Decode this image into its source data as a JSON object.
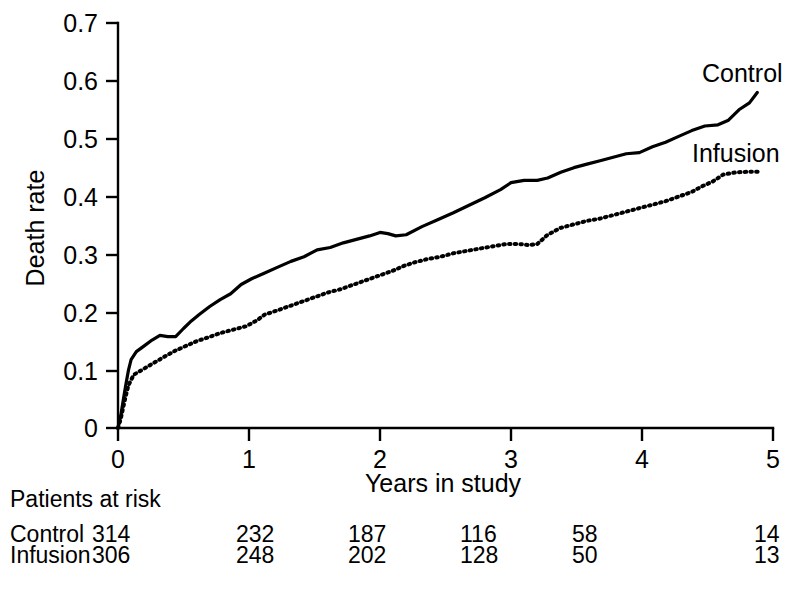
{
  "chart_data": {
    "type": "line",
    "title": "",
    "xlabel": "Years in study",
    "ylabel": "Death rate",
    "xlim": [
      0,
      5
    ],
    "ylim": [
      0,
      0.7
    ],
    "xticks": [
      "0",
      "1",
      "2",
      "3",
      "4",
      "5"
    ],
    "xtick_values": [
      0,
      1,
      2,
      3,
      4,
      5
    ],
    "yticks": [
      "0",
      "0.1",
      "0.2",
      "0.3",
      "0.4",
      "0.5",
      "0.6",
      "0.7"
    ],
    "ytick_values": [
      0,
      0.1,
      0.2,
      0.3,
      0.4,
      0.5,
      0.6,
      0.7
    ],
    "grid": false,
    "legend_position": "inline-right-of-curves",
    "series": [
      {
        "name": "Control",
        "style": "solid",
        "label": "Control",
        "x": [
          0.0,
          0.02,
          0.04,
          0.06,
          0.08,
          0.1,
          0.14,
          0.2,
          0.26,
          0.32,
          0.38,
          0.44,
          0.5,
          0.56,
          0.62,
          0.7,
          0.78,
          0.86,
          0.94,
          1.02,
          1.12,
          1.22,
          1.32,
          1.42,
          1.52,
          1.62,
          1.72,
          1.82,
          1.92,
          2.0,
          2.06,
          2.12,
          2.2,
          2.32,
          2.44,
          2.56,
          2.68,
          2.8,
          2.92,
          3.0,
          3.1,
          3.2,
          3.28,
          3.38,
          3.48,
          3.58,
          3.68,
          3.78,
          3.88,
          3.98,
          4.08,
          4.18,
          4.28,
          4.38,
          4.48,
          4.58,
          4.66,
          4.74,
          4.82,
          4.88
        ],
        "y": [
          0.0,
          0.02,
          0.048,
          0.075,
          0.1,
          0.118,
          0.132,
          0.142,
          0.152,
          0.16,
          0.158,
          0.158,
          0.172,
          0.185,
          0.196,
          0.21,
          0.222,
          0.232,
          0.248,
          0.258,
          0.268,
          0.278,
          0.288,
          0.296,
          0.308,
          0.312,
          0.32,
          0.326,
          0.332,
          0.338,
          0.336,
          0.332,
          0.334,
          0.348,
          0.36,
          0.372,
          0.385,
          0.398,
          0.412,
          0.424,
          0.428,
          0.428,
          0.432,
          0.442,
          0.45,
          0.456,
          0.462,
          0.468,
          0.474,
          0.476,
          0.486,
          0.494,
          0.504,
          0.514,
          0.522,
          0.524,
          0.532,
          0.55,
          0.562,
          0.58
        ]
      },
      {
        "name": "Infusion",
        "style": "dotted",
        "label": "Infusion",
        "x": [
          0.0,
          0.02,
          0.04,
          0.06,
          0.08,
          0.12,
          0.18,
          0.24,
          0.3,
          0.36,
          0.44,
          0.52,
          0.6,
          0.68,
          0.78,
          0.88,
          0.98,
          1.06,
          1.12,
          1.2,
          1.3,
          1.4,
          1.5,
          1.6,
          1.7,
          1.8,
          1.9,
          2.0,
          2.1,
          2.18,
          2.26,
          2.36,
          2.46,
          2.56,
          2.66,
          2.76,
          2.86,
          2.96,
          3.06,
          3.14,
          3.2,
          3.28,
          3.38,
          3.48,
          3.58,
          3.68,
          3.78,
          3.88,
          3.98,
          4.08,
          4.18,
          4.28,
          4.38,
          4.46,
          4.54,
          4.62,
          4.72,
          4.82,
          4.9
        ],
        "y": [
          0.0,
          0.015,
          0.036,
          0.056,
          0.074,
          0.092,
          0.1,
          0.108,
          0.116,
          0.124,
          0.134,
          0.142,
          0.15,
          0.156,
          0.164,
          0.17,
          0.176,
          0.186,
          0.196,
          0.202,
          0.21,
          0.218,
          0.226,
          0.234,
          0.24,
          0.248,
          0.256,
          0.264,
          0.272,
          0.28,
          0.286,
          0.292,
          0.296,
          0.302,
          0.306,
          0.31,
          0.314,
          0.318,
          0.318,
          0.316,
          0.318,
          0.334,
          0.346,
          0.352,
          0.358,
          0.362,
          0.368,
          0.374,
          0.38,
          0.386,
          0.392,
          0.4,
          0.408,
          0.418,
          0.426,
          0.438,
          0.442,
          0.443,
          0.443
        ]
      }
    ]
  },
  "risk_table": {
    "heading": "Patients at risk",
    "column_x_values": [
      0,
      1,
      2,
      3,
      4,
      5
    ],
    "rows": [
      {
        "label": "Control",
        "values": [
          "314",
          "232",
          "187",
          "116",
          "58",
          "14"
        ]
      },
      {
        "label": "Infusion",
        "values": [
          "306",
          "248",
          "202",
          "128",
          "50",
          "13"
        ]
      }
    ]
  }
}
